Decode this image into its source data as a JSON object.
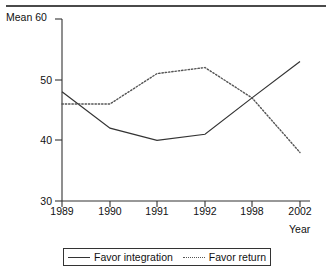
{
  "chart_data": {
    "type": "line",
    "title": "",
    "xlabel": "Year",
    "ylabel": "Mean",
    "categories": [
      "1989",
      "1990",
      "1991",
      "1992",
      "1998",
      "2002"
    ],
    "x": [
      1989,
      1990,
      1991,
      1992,
      1998,
      2002
    ],
    "ylim": [
      30,
      60
    ],
    "yticks": [
      30,
      40,
      50,
      60
    ],
    "ytick_labels": [
      "30",
      "40",
      "50",
      "60"
    ],
    "xtick_labels": [
      "1989",
      "1990",
      "1991",
      "1992",
      "1998",
      "2002"
    ],
    "grid": false,
    "legend_position": "bottom-center",
    "series": [
      {
        "name": "Favor integration",
        "style": "solid",
        "color": "#333333",
        "values": [
          48,
          42,
          40,
          41,
          47,
          53
        ]
      },
      {
        "name": "Favor return",
        "style": "dotted",
        "color": "#555555",
        "values": [
          46,
          46,
          51,
          52,
          47,
          38
        ]
      }
    ]
  },
  "axes": {
    "y_title": "Mean",
    "y_top_label": "60",
    "y_labels": [
      "60",
      "50",
      "40",
      "30"
    ],
    "x_labels": [
      "1989",
      "1990",
      "1991",
      "1992",
      "1998",
      "2002"
    ],
    "x_title": "Year"
  },
  "legend": {
    "entries": [
      {
        "label": "Favor integration",
        "style": "solid"
      },
      {
        "label": "Favor return",
        "style": "dotted"
      }
    ]
  }
}
